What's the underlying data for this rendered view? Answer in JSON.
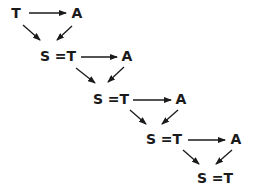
{
  "diagram": {
    "nodes": [
      {
        "id": "t0",
        "label": "T",
        "x": 16,
        "y": 13
      },
      {
        "id": "a0",
        "label": "A",
        "x": 77,
        "y": 13
      },
      {
        "id": "s1",
        "label": "S =T",
        "x": 50,
        "y": 55
      },
      {
        "id": "a1",
        "label": "A",
        "x": 127,
        "y": 55
      },
      {
        "id": "s2",
        "label": "S =T",
        "x": 104,
        "y": 98
      },
      {
        "id": "a2",
        "label": "A",
        "x": 181,
        "y": 98
      },
      {
        "id": "s3",
        "label": "S =T",
        "x": 155,
        "y": 138
      },
      {
        "id": "a3",
        "label": "A",
        "x": 236,
        "y": 138
      },
      {
        "id": "s4",
        "label": "S =T",
        "x": 208,
        "y": 178
      }
    ],
    "edges": [
      {
        "from": "t0",
        "to": "a0"
      },
      {
        "from": "t0",
        "to": "s1"
      },
      {
        "from": "a0",
        "to": "s1"
      },
      {
        "from": "s1",
        "to": "a1"
      },
      {
        "from": "s1",
        "to": "s2"
      },
      {
        "from": "a1",
        "to": "s2"
      },
      {
        "from": "s2",
        "to": "a2"
      },
      {
        "from": "s2",
        "to": "s3"
      },
      {
        "from": "a2",
        "to": "s3"
      },
      {
        "from": "s3",
        "to": "a3"
      },
      {
        "from": "s3",
        "to": "s4"
      },
      {
        "from": "a3",
        "to": "s4"
      }
    ],
    "colors": {
      "ink": "#1a1a1a",
      "background": "#ffffff"
    }
  }
}
